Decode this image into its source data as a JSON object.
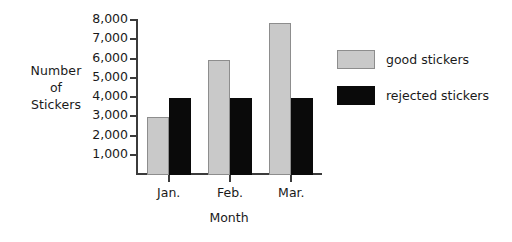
{
  "chart_data": {
    "type": "bar",
    "title": "",
    "xlabel": "Month",
    "ylabel": "Number of Stickers",
    "ylabel_lines": [
      "Number",
      "of",
      "Stickers"
    ],
    "categories": [
      "Jan.",
      "Feb.",
      "Mar."
    ],
    "series": [
      {
        "name": "good stickers",
        "color": "#c9c9c9",
        "values": [
          3000,
          6000,
          7900
        ]
      },
      {
        "name": "rejected stickers",
        "color": "#0a0a0a",
        "values": [
          4000,
          4000,
          4000
        ]
      }
    ],
    "ylim": [
      0,
      8000
    ],
    "ytick_values": [
      1000,
      2000,
      3000,
      4000,
      5000,
      6000,
      7000,
      8000
    ],
    "ytick_labels": [
      "1,000",
      "2,000",
      "3,000",
      "4,000",
      "5,000",
      "6,000",
      "7,000",
      "8,000"
    ],
    "grid": false,
    "legend_position": "right",
    "axis_color": "#3b3b3b",
    "background": "#ffffff"
  }
}
